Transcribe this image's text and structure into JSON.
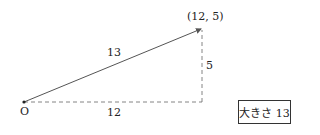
{
  "diagram": {
    "origin_label": "O",
    "point_label": "(12, 5)",
    "hypotenuse_label": "13",
    "horizontal_label": "12",
    "vertical_label": "5",
    "magnitude_box": "大きさ 13",
    "colors": {
      "line": "#555555",
      "text": "#222222"
    }
  }
}
